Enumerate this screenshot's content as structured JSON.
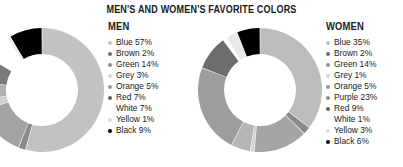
{
  "chart_data": [
    {
      "type": "pie",
      "title": "MEN'S AND WOMEN'S FAVORITE COLORS",
      "subtitle": "MEN",
      "legend_position": "right",
      "grid": false,
      "donut_hole_ratio": 0.58,
      "categories": [
        "Blue",
        "Brown",
        "Green",
        "Grey",
        "Orange",
        "Red",
        "White",
        "Yellow",
        "Black"
      ],
      "values": [
        57,
        2,
        14,
        3,
        5,
        7,
        7,
        1,
        9
      ],
      "labels": [
        "Blue 57%",
        "Brown 2%",
        "Green 14%",
        "Grey 3%",
        "Orange 5%",
        "Red 7%",
        "White 7%",
        "Yellow 1%",
        "Black 9%"
      ],
      "slice_colors": [
        "#c2c2c2",
        "#8a8a8a",
        "#a3a3a3",
        "#cfcfcf",
        "#b0b0b0",
        "#7a7a7a",
        "#ffffff",
        "#ededed",
        "#000000"
      ],
      "bullet_colors": [
        "#c2c2c2",
        "#6e6e6e",
        "#8f8f8f",
        "#d6d6d6",
        "#9a9a9a",
        "#5e5e5e",
        "#ffffff",
        "#dddddd",
        "#000000"
      ]
    },
    {
      "type": "pie",
      "title": "MEN'S AND WOMEN'S FAVORITE COLORS",
      "subtitle": "WOMEN",
      "legend_position": "right",
      "grid": false,
      "donut_hole_ratio": 0.58,
      "categories": [
        "Blue",
        "Brown",
        "Green",
        "Grey",
        "Orange",
        "Purple",
        "Red",
        "White",
        "Yellow",
        "Black"
      ],
      "values": [
        35,
        2,
        14,
        1,
        5,
        23,
        9,
        1,
        3,
        6
      ],
      "labels": [
        "Blue 35%",
        "Brown 2%",
        "Green 14%",
        "Grey 1%",
        "Orange 5%",
        "Purple 23%",
        "Red 9%",
        "White 1%",
        "Yellow 3%",
        "Black 6%"
      ],
      "slice_colors": [
        "#bcbcbc",
        "#8a8a8a",
        "#a5a5a5",
        "#d2d2d2",
        "#b5b5b5",
        "#9d9d9d",
        "#6d6d6d",
        "#ffffff",
        "#e8e8e8",
        "#000000"
      ],
      "bullet_colors": [
        "#c2c2c2",
        "#6e6e6e",
        "#8f8f8f",
        "#d6d6d6",
        "#9a9a9a",
        "#8a8a8a",
        "#5e5e5e",
        "#ffffff",
        "#dddddd",
        "#000000"
      ]
    }
  ],
  "header": {
    "title": "MEN'S AND WOMEN'S FAVORITE COLORS"
  },
  "men": {
    "heading": "MEN",
    "legend": [
      {
        "label": "Blue 57%",
        "color": "#c2c2c2"
      },
      {
        "label": "Brown 2%",
        "color": "#6e6e6e"
      },
      {
        "label": "Green 14%",
        "color": "#8f8f8f"
      },
      {
        "label": "Grey 3%",
        "color": "#d6d6d6"
      },
      {
        "label": "Orange 5%",
        "color": "#9a9a9a"
      },
      {
        "label": "Red 7%",
        "color": "#5e5e5e"
      },
      {
        "label": "White 7%",
        "color": "#ffffff"
      },
      {
        "label": "Yellow 1%",
        "color": "#dddddd"
      },
      {
        "label": "Black 9%",
        "color": "#000000"
      }
    ]
  },
  "women": {
    "heading": "WOMEN",
    "legend": [
      {
        "label": "Blue 35%",
        "color": "#c2c2c2"
      },
      {
        "label": "Brown 2%",
        "color": "#6e6e6e"
      },
      {
        "label": "Green 14%",
        "color": "#8f8f8f"
      },
      {
        "label": "Grey 1%",
        "color": "#d6d6d6"
      },
      {
        "label": "Orange 5%",
        "color": "#9a9a9a"
      },
      {
        "label": "Purple 23%",
        "color": "#8a8a8a"
      },
      {
        "label": "Red 9%",
        "color": "#5e5e5e"
      },
      {
        "label": "White 1%",
        "color": "#ffffff"
      },
      {
        "label": "Yellow 3%",
        "color": "#dddddd"
      },
      {
        "label": "Black 6%",
        "color": "#000000"
      }
    ]
  }
}
